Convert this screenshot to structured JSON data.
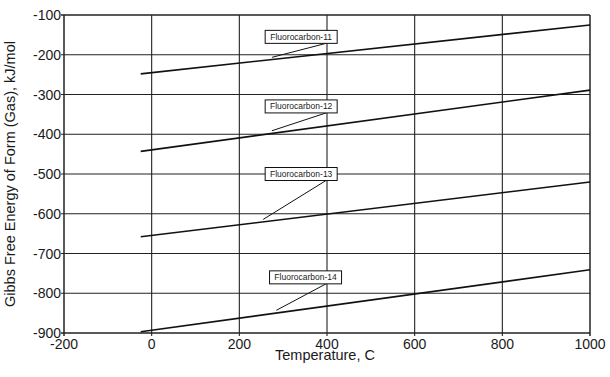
{
  "chart_data": {
    "type": "line",
    "title": "",
    "xlabel": "Temperature, C",
    "ylabel": "Gibbs Free Energy of Form (Gas), kJ/mol",
    "xlim": [
      -200,
      1000
    ],
    "ylim": [
      -900,
      -100
    ],
    "xticks": [
      -200,
      0,
      200,
      400,
      600,
      800,
      1000
    ],
    "yticks": [
      -100,
      -200,
      -300,
      -400,
      -500,
      -600,
      -700,
      -800,
      -900
    ],
    "xtick_labels": [
      "-200",
      "0",
      "200",
      "400",
      "600",
      "800",
      "1000"
    ],
    "ytick_labels": [
      "-100",
      "-200",
      "-300",
      "-400",
      "-500",
      "-600",
      "-700",
      "-800",
      "-900"
    ],
    "grid": true,
    "legend": "callout labels on each line",
    "series": [
      {
        "name": "Fluorocarbon-11",
        "x": [
          -25,
          1000
        ],
        "y": [
          -248,
          -125
        ],
        "label_anchor_x": 320
      },
      {
        "name": "Fluorocarbon-12",
        "x": [
          -25,
          1000
        ],
        "y": [
          -443,
          -289
        ],
        "label_anchor_x": 320
      },
      {
        "name": "Fluorocarbon-13",
        "x": [
          -25,
          1000
        ],
        "y": [
          -658,
          -520
        ],
        "label_anchor_x": 300
      },
      {
        "name": "Fluorocarbon-14",
        "x": [
          -25,
          1000
        ],
        "y": [
          -897,
          -741
        ],
        "label_anchor_x": 330
      }
    ],
    "callouts": [
      {
        "text": "Fluorocarbon-11",
        "box_x": 300,
        "box_y": -155
      },
      {
        "text": "Fluorocarbon-12",
        "box_x": 300,
        "box_y": -330
      },
      {
        "text": "Fluorocarbon-13",
        "box_x": 300,
        "box_y": -500
      },
      {
        "text": "Fluorocarbon-14",
        "box_x": 310,
        "box_y": -760
      }
    ]
  }
}
